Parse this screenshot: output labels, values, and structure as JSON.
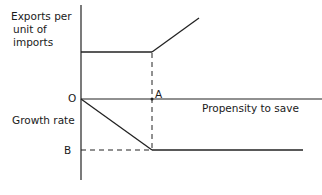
{
  "diagram": {
    "upper_axis_label": [
      "Exports per",
      "unit of",
      "imports"
    ],
    "lower_axis_label": "Growth rate",
    "x_axis_label": "Propensity to save",
    "origin_label": "O",
    "point_a_label": "A",
    "point_b_label": "B",
    "caption": "",
    "colors": {
      "line": "#222222",
      "background": "#ffffff"
    }
  }
}
